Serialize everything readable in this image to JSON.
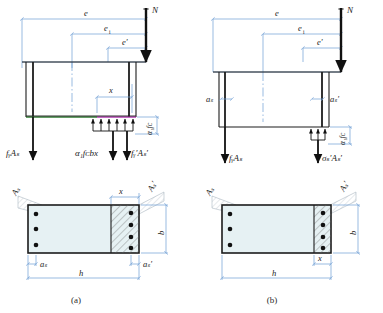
{
  "figure": {
    "caption_a": "(a)",
    "caption_b": "(b)"
  },
  "panel_a": {
    "force_label_N": "N",
    "dim_e": "e",
    "dim_ei": "e",
    "dim_ei_sub": "i",
    "dim_e_prime": "e'",
    "dim_x": "x",
    "stress_block_label": "α₁fᴄ",
    "left_force": "fᵧAₛ",
    "mid_force": "α₁fᴄbx",
    "right_force": "fᵧ′Aₛ′",
    "section": {
      "label_As": "Aₛ",
      "label_As_prime": "Aₛ′",
      "dim_x": "x",
      "dim_b": "b",
      "dim_h": "h",
      "dim_as": "aₛ",
      "dim_as_prime": "aₛ′",
      "bars_left": 3,
      "bars_right": 4
    }
  },
  "panel_b": {
    "force_label_N": "N",
    "dim_e": "e",
    "dim_ei": "e",
    "dim_ei_sub": "i",
    "dim_e_prime": "e'",
    "dim_as": "aₛ",
    "dim_as_prime": "aₛ′",
    "stress_block_label": "α₁fᴄ",
    "left_force": "fᵧAₛ",
    "right_force": "σₛ′Aₛ′",
    "section": {
      "label_As": "Aₛ",
      "label_As_prime": "Aₛ′",
      "dim_x": "x",
      "dim_b": "b",
      "dim_h": "h",
      "bars_left": 3,
      "bars_right": 4
    }
  },
  "colors": {
    "dimension_blue": "#6f9dd4",
    "outline_dark": "#1c1c1c",
    "concrete_fill": "#e6f1f3",
    "green_edge": "#2f7d32",
    "magenta_edge": "#b23ab2",
    "hatch": "#6a6a6a"
  }
}
